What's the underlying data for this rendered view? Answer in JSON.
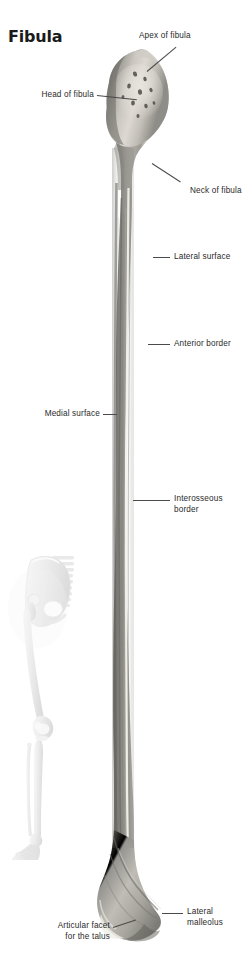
{
  "page": {
    "title": "Fibula",
    "background_color": "#ffffff",
    "text_color": "#2a2a2a",
    "leader_line_color": "#4a4a4a",
    "width": 245,
    "height": 975
  },
  "figure": {
    "name": "fibula-bone-photograph",
    "view": "lateral",
    "bone_color_dark": "#6f6f6c",
    "bone_color_mid": "#a9a7a2",
    "bone_color_light": "#e4e2dc",
    "bone_color_highlight": "#f2f0ea"
  },
  "orientation_figure": {
    "name": "skeleton-orientation-figure",
    "color": "#ededed",
    "shadow_color": "#d8d8d8"
  },
  "labels": [
    {
      "id": "apex-of-fibula",
      "text": "Apex of fibula",
      "align": "left"
    },
    {
      "id": "head-of-fibula",
      "text": "Head of fibula",
      "align": "right"
    },
    {
      "id": "neck-of-fibula",
      "text": "Neck of fibula",
      "align": "left"
    },
    {
      "id": "lateral-surface",
      "text": "Lateral surface",
      "align": "left"
    },
    {
      "id": "anterior-border",
      "text": "Anterior border",
      "align": "left"
    },
    {
      "id": "medial-surface",
      "text": "Medial surface",
      "align": "right"
    },
    {
      "id": "interosseous-border",
      "text": "Interosseous\nborder",
      "align": "left"
    },
    {
      "id": "lateral-malleolus",
      "text": "Lateral\nmalleolus",
      "align": "left"
    },
    {
      "id": "articular-facet-for-the-talus",
      "text": "Articular facet\nfor the talus",
      "align": "right"
    }
  ]
}
